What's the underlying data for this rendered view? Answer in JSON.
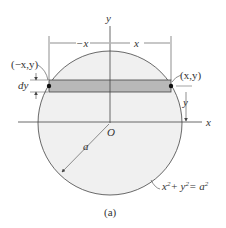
{
  "figure": {
    "caption": "(a)",
    "labels": {
      "y_axis": "y",
      "x_axis": "x",
      "origin": "O",
      "left_width": "−x",
      "right_width": "x",
      "left_point": "(−x,y)",
      "right_point": "(x,y)",
      "strip_height": "dy",
      "strip_y": "y",
      "radius": "a",
      "equation_x": "x",
      "equation_y": "+ y",
      "equation_a": "= a",
      "exponent": "2"
    },
    "colors": {
      "circle_fill": "#f0f0f0",
      "strip_fill": "#b8b8b8",
      "line": "#444444"
    }
  }
}
